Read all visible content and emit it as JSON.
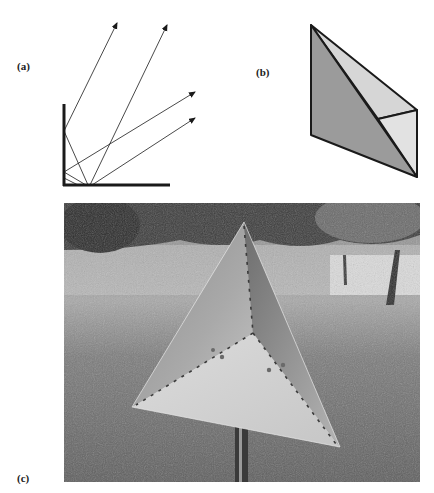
{
  "figure": {
    "panels": [
      {
        "id": "a",
        "label": "(a)",
        "description": "Corner reflector diagram: two perpendicular mirrors with incoming and reflected rays (arrows)"
      },
      {
        "id": "b",
        "label": "(b)",
        "description": "Shaded 3D line drawing of a trihedral corner reflector"
      },
      {
        "id": "c",
        "label": "(c)",
        "description": "Photograph of a triangular trihedral corner reflector mounted on a pole in a grassy field with trees"
      }
    ]
  },
  "colors": {
    "ink": "#1a1a1a",
    "face_dark": "#9b9b9b",
    "face_light": "#d6d6d6",
    "face_lighter": "#e2e2e2"
  }
}
